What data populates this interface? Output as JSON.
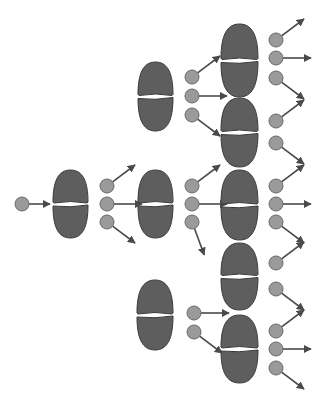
{
  "diagram": {
    "type": "nuclear-chain-reaction",
    "title": "",
    "colors": {
      "background": "#ffffff",
      "nucleus_fill": "#5e5e5e",
      "nucleus_stroke": "#3a3a3a",
      "neutron_fill": "#9a9a9a",
      "neutron_stroke": "#6a6a6a",
      "arrow": "#4a4a4a"
    },
    "incoming_neutron": {
      "cx": 22,
      "cy": 204,
      "arrow_to": [
        50,
        204
      ]
    },
    "nuclei": [
      {
        "id": "gen1",
        "x": 53,
        "y": 170,
        "w": 35,
        "h": 68,
        "neutrons": [
          {
            "cx": 107,
            "cy": 186,
            "dir": "up-right"
          },
          {
            "cx": 107,
            "cy": 204,
            "dir": "right"
          },
          {
            "cx": 107,
            "cy": 222,
            "dir": "down-right"
          }
        ]
      },
      {
        "id": "gen2-top",
        "x": 138,
        "y": 62,
        "w": 35,
        "h": 69,
        "neutrons": [
          {
            "cx": 192,
            "cy": 77,
            "dir": "up-right"
          },
          {
            "cx": 192,
            "cy": 96,
            "dir": "right"
          },
          {
            "cx": 192,
            "cy": 115,
            "dir": "down-right"
          }
        ]
      },
      {
        "id": "gen2-mid",
        "x": 138,
        "y": 170,
        "w": 35,
        "h": 68,
        "neutrons": [
          {
            "cx": 192,
            "cy": 186,
            "dir": "up-right"
          },
          {
            "cx": 192,
            "cy": 204,
            "dir": "right"
          },
          {
            "cx": 192,
            "cy": 222,
            "dir": "down"
          }
        ]
      },
      {
        "id": "gen2-bot",
        "x": 137,
        "y": 280,
        "w": 36,
        "h": 70,
        "neutrons": [
          {
            "cx": 194,
            "cy": 313,
            "dir": "right"
          },
          {
            "cx": 194,
            "cy": 332,
            "dir": "down-right"
          }
        ]
      },
      {
        "id": "gen3-1",
        "x": 221,
        "y": 24,
        "w": 37,
        "h": 73,
        "neutrons": [
          {
            "cx": 276,
            "cy": 40,
            "dir": "up-right"
          },
          {
            "cx": 276,
            "cy": 58,
            "dir": "right"
          },
          {
            "cx": 276,
            "cy": 78,
            "dir": "down-right"
          }
        ]
      },
      {
        "id": "gen3-2",
        "x": 221,
        "y": 98,
        "w": 37,
        "h": 69,
        "neutrons": [
          {
            "cx": 276,
            "cy": 121,
            "dir": "up-right"
          },
          {
            "cx": 276,
            "cy": 143,
            "dir": "down-right"
          }
        ]
      },
      {
        "id": "gen3-3",
        "x": 221,
        "y": 170,
        "w": 37,
        "h": 70,
        "neutrons": [
          {
            "cx": 276,
            "cy": 186,
            "dir": "up-right"
          },
          {
            "cx": 276,
            "cy": 204,
            "dir": "right"
          },
          {
            "cx": 276,
            "cy": 222,
            "dir": "down-right"
          }
        ]
      },
      {
        "id": "gen3-4",
        "x": 221,
        "y": 243,
        "w": 37,
        "h": 67,
        "neutrons": [
          {
            "cx": 276,
            "cy": 263,
            "dir": "up-right"
          },
          {
            "cx": 276,
            "cy": 289,
            "dir": "down-right"
          }
        ]
      },
      {
        "id": "gen3-5",
        "x": 221,
        "y": 315,
        "w": 37,
        "h": 68,
        "neutrons": [
          {
            "cx": 276,
            "cy": 331,
            "dir": "up-right"
          },
          {
            "cx": 276,
            "cy": 349,
            "dir": "right"
          },
          {
            "cx": 276,
            "cy": 368,
            "dir": "down-right"
          }
        ]
      }
    ]
  }
}
